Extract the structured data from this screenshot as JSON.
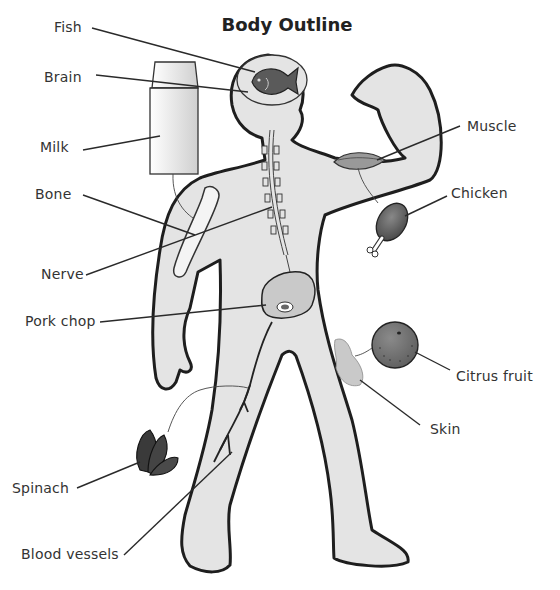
{
  "title": "Body Outline",
  "labels": {
    "fish": "Fish",
    "brain": "Brain",
    "milk": "Milk",
    "bone": "Bone",
    "nerve": "Nerve",
    "pork_chop": "Pork chop",
    "spinach": "Spinach",
    "blood_vessels": "Blood vessels",
    "muscle": "Muscle",
    "chicken": "Chicken",
    "citrus_fruit": "Citrus fruit",
    "skin": "Skin"
  },
  "colors": {
    "body_fill": "#e4e4e4",
    "outline": "#1e1e1e",
    "food_dark": "#6a6a6a",
    "background": "#ffffff"
  }
}
